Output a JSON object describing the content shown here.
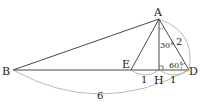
{
  "diagram": {
    "type": "geometry",
    "points": {
      "A": {
        "label": "A"
      },
      "B": {
        "label": "B"
      },
      "E": {
        "label": "E"
      },
      "H": {
        "label": "H"
      },
      "D": {
        "label": "D"
      }
    },
    "measures": {
      "EH": "1",
      "HD": "1",
      "AD": "2",
      "BD": "6",
      "angle_HAD": "30°",
      "angle_ADH": "60°"
    },
    "colors": {
      "stroke": "#333333",
      "arc": "#999999",
      "text": "#222222"
    }
  }
}
